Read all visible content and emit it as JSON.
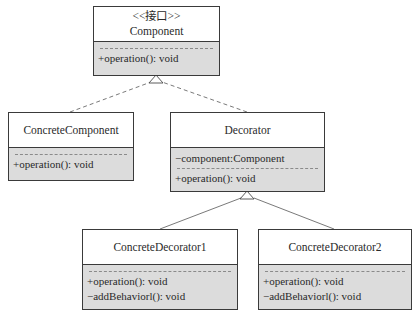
{
  "diagram": {
    "type": "UML class diagram - Decorator pattern",
    "classes": {
      "component": {
        "stereotype": "<<接口>>",
        "name": "Component",
        "attributes": [],
        "operations": [
          "+operation(): void"
        ]
      },
      "concrete_component": {
        "name": "ConcreteComponent",
        "attributes": [],
        "operations": [
          "+operation(): void"
        ]
      },
      "decorator": {
        "name": "Decorator",
        "attributes": [
          "−component:Component"
        ],
        "operations": [
          "+operation(): void"
        ]
      },
      "concrete_decorator1": {
        "name": "ConcreteDecorator1",
        "attributes": [],
        "operations": [
          "+operation(): void",
          "−addBehaviorl(): void"
        ]
      },
      "concrete_decorator2": {
        "name": "ConcreteDecorator2",
        "attributes": [],
        "operations": [
          "+operation(): void",
          "−addBehaviorl(): void"
        ]
      }
    },
    "relationships": [
      {
        "from": "ConcreteComponent",
        "to": "Component",
        "kind": "realization",
        "style": "dashed, hollow triangle"
      },
      {
        "from": "Decorator",
        "to": "Component",
        "kind": "realization",
        "style": "dashed, hollow triangle"
      },
      {
        "from": "ConcreteDecorator1",
        "to": "Decorator",
        "kind": "generalization",
        "style": "solid, hollow triangle"
      },
      {
        "from": "ConcreteDecorator2",
        "to": "Decorator",
        "kind": "generalization",
        "style": "solid, hollow triangle"
      }
    ],
    "colors": {
      "border": "#3a3a3a",
      "compartment_fill": "#dcdcdc",
      "header_fill": "#ffffff",
      "line": "#6a6a6a"
    }
  }
}
